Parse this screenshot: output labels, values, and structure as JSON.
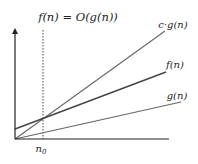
{
  "diagram": {
    "title": "f(n) = O(g(n))",
    "threshold_label": "n",
    "threshold_subscript": "0",
    "curves": [
      {
        "id": "cg",
        "label": "c·g(n)",
        "color": "#666666",
        "width": 1.1
      },
      {
        "id": "f",
        "label": "f(n)",
        "color": "#444444",
        "width": 1.4
      },
      {
        "id": "g",
        "label": "g(n)",
        "color": "#666666",
        "width": 1.1
      }
    ],
    "axes": {
      "x_axis_label": "",
      "y_axis_label": "",
      "color": "#222222"
    },
    "threshold_line": {
      "style": "dotted",
      "color": "#444444"
    }
  }
}
